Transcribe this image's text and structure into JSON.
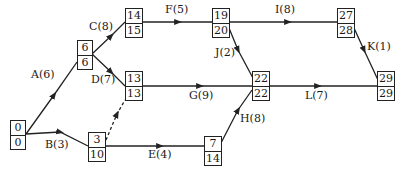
{
  "diagram": {
    "type": "activity-on-arrow network (critical path)",
    "nodes": [
      {
        "id": "n0",
        "earliest": "0",
        "latest": "0"
      },
      {
        "id": "n6",
        "earliest": "6",
        "latest": "6"
      },
      {
        "id": "n14",
        "earliest": "14",
        "latest": "15"
      },
      {
        "id": "n13",
        "earliest": "13",
        "latest": "13"
      },
      {
        "id": "n3",
        "earliest": "3",
        "latest": "10"
      },
      {
        "id": "n19",
        "earliest": "19",
        "latest": "20"
      },
      {
        "id": "n22",
        "earliest": "22",
        "latest": "22"
      },
      {
        "id": "n7",
        "earliest": "7",
        "latest": "14"
      },
      {
        "id": "n27",
        "earliest": "27",
        "latest": "28"
      },
      {
        "id": "n29",
        "earliest": "29",
        "latest": "29"
      }
    ],
    "activities": [
      {
        "label": "A(6)",
        "from": "n0",
        "to": "n6"
      },
      {
        "label": "B(3)",
        "from": "n0",
        "to": "n3"
      },
      {
        "label": "C(8)",
        "from": "n6",
        "to": "n14"
      },
      {
        "label": "D(7)",
        "from": "n6",
        "to": "n13"
      },
      {
        "label": "E(4)",
        "from": "n3",
        "to": "n7"
      },
      {
        "label": "F(5)",
        "from": "n14",
        "to": "n19"
      },
      {
        "label": "G(9)",
        "from": "n13",
        "to": "n22"
      },
      {
        "label": "H(8)",
        "from": "n7",
        "to": "n22"
      },
      {
        "label": "I(8)",
        "from": "n19",
        "to": "n27"
      },
      {
        "label": "J(2)",
        "from": "n19",
        "to": "n22"
      },
      {
        "label": "K(1)",
        "from": "n27",
        "to": "n29"
      },
      {
        "label": "L(7)",
        "from": "n22",
        "to": "n29"
      }
    ],
    "dummy": {
      "from": "n3",
      "to": "n13",
      "style": "dashed"
    }
  }
}
